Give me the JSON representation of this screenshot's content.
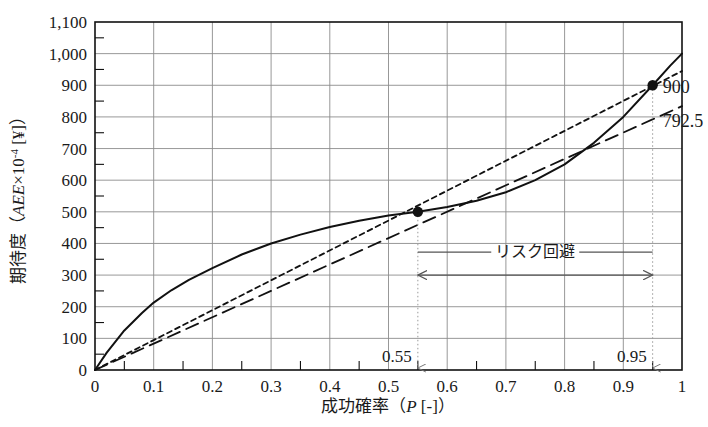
{
  "chart_data": {
    "type": "line",
    "title": "",
    "xlabel": "成功確率（P [-]）",
    "xlabel_main": "成功確率",
    "xlabel_paren_open": "（",
    "xlabel_symbol": "P",
    "xlabel_unit": " [-]",
    "xlabel_paren_close": "）",
    "ylabel": "期待度（AEE×10⁻⁴ [¥]）",
    "ylabel_main": "期待度",
    "ylabel_paren_open": "（",
    "ylabel_symbol": "AEE",
    "ylabel_mult": "×10",
    "ylabel_exp": "-4",
    "ylabel_unit": " [¥]",
    "ylabel_paren_close": "）",
    "xlim": [
      0,
      1
    ],
    "ylim": [
      0,
      1100
    ],
    "xticks": [
      0,
      0.1,
      0.2,
      0.3,
      0.4,
      0.5,
      0.6,
      0.7,
      0.8,
      0.9,
      1
    ],
    "xtick_labels": [
      "0",
      "0.1",
      "0.2",
      "0.3",
      "0.4",
      "0.5",
      "0.6",
      "0.7",
      "0.8",
      "0.9",
      "1"
    ],
    "yticks": [
      0,
      100,
      200,
      300,
      400,
      500,
      600,
      700,
      800,
      900,
      1000,
      1100
    ],
    "ytick_labels": [
      "0",
      "100",
      "200",
      "300",
      "400",
      "500",
      "600",
      "700",
      "800",
      "900",
      "1,000",
      "1,100"
    ],
    "x_minor_step": 0.05,
    "y_minor_step": 50,
    "grid": true,
    "legend": "none",
    "series": [
      {
        "name": "utility-curve",
        "style": "solid",
        "color": "#111111",
        "x": [
          0,
          0.02,
          0.05,
          0.08,
          0.1,
          0.13,
          0.16,
          0.2,
          0.25,
          0.3,
          0.35,
          0.4,
          0.45,
          0.5,
          0.55,
          0.6,
          0.65,
          0.7,
          0.75,
          0.8,
          0.85,
          0.9,
          0.95,
          0.98,
          1.0
        ],
        "y": [
          0,
          55,
          125,
          180,
          213,
          252,
          285,
          322,
          365,
          400,
          428,
          452,
          472,
          488,
          500,
          515,
          535,
          562,
          600,
          650,
          718,
          800,
          900,
          962,
          1000
        ]
      },
      {
        "name": "chord-line-short-dash",
        "style": "short-dash",
        "color": "#111111",
        "x": [
          0,
          1
        ],
        "y": [
          0,
          945
        ]
      },
      {
        "name": "reference-line-long-dash",
        "style": "long-dash",
        "color": "#111111",
        "x": [
          0,
          1
        ],
        "y": [
          0,
          834
        ]
      }
    ],
    "markers": [
      {
        "name": "point-low",
        "x": 0.55,
        "y": 500,
        "label": ""
      },
      {
        "name": "point-high",
        "x": 0.95,
        "y": 900,
        "label": "900"
      }
    ],
    "annotations": [
      {
        "name": "risk-aversion-span",
        "text": "リスク回避",
        "x_start": 0.55,
        "x_end": 0.95,
        "y": 300
      },
      {
        "name": "value-900",
        "text": "900",
        "x": 0.95,
        "y": 900
      },
      {
        "name": "value-792-5",
        "text": "792.5",
        "x": 0.95,
        "y": 792.5
      },
      {
        "name": "guide-0-55",
        "text": "0.55",
        "x": 0.55
      },
      {
        "name": "guide-0-95",
        "text": "0.95",
        "x": 0.95
      }
    ]
  },
  "labels": {
    "risk_aversion": "リスク回避",
    "value_900": "900",
    "value_792_5": "792.5",
    "guide_055": "0.55",
    "guide_095": "0.95"
  }
}
